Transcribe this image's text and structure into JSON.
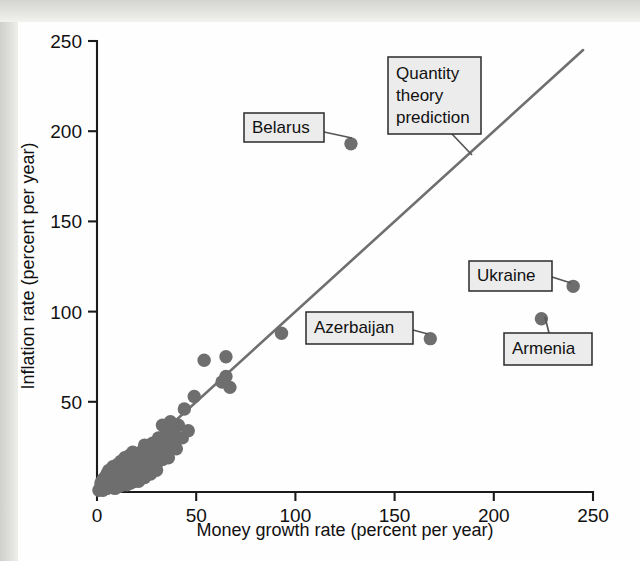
{
  "figure": {
    "background_color": "#fefefe",
    "margin_color": "#dcdcd8"
  },
  "chart_data": {
    "type": "scatter",
    "title": "",
    "xlabel": "Money growth rate (percent per year)",
    "ylabel": "Inflation rate (percent per year)",
    "xlim": [
      0,
      250
    ],
    "ylim": [
      0,
      250
    ],
    "xticks": [
      0,
      50,
      100,
      150,
      200,
      250
    ],
    "yticks": [
      50,
      100,
      150,
      200,
      250
    ],
    "xtick_labels": [
      "0",
      "50",
      "100",
      "150",
      "200",
      "250"
    ],
    "ytick_labels": [
      "50",
      "100",
      "150",
      "200",
      "250"
    ],
    "grid": false,
    "legend": "none",
    "marker_color": "#6e6e6e",
    "marker_size": 7,
    "reference_line": {
      "name": "Quantity theory prediction",
      "type": "line",
      "slope": 1,
      "intercept": 0,
      "x": [
        0,
        245
      ],
      "y": [
        0,
        245
      ],
      "color": "#6f6f6f"
    },
    "points": [
      {
        "x": 128,
        "y": 193,
        "label": "Belarus"
      },
      {
        "x": 168,
        "y": 85,
        "label": "Azerbaijan"
      },
      {
        "x": 240,
        "y": 114,
        "label": "Ukraine"
      },
      {
        "x": 224,
        "y": 96,
        "label": "Armenia"
      },
      {
        "x": 93,
        "y": 88,
        "label": ""
      },
      {
        "x": 65,
        "y": 75,
        "label": ""
      },
      {
        "x": 54,
        "y": 73,
        "label": ""
      },
      {
        "x": 65,
        "y": 64,
        "label": ""
      },
      {
        "x": 63,
        "y": 61,
        "label": ""
      },
      {
        "x": 67,
        "y": 58,
        "label": ""
      },
      {
        "x": 49,
        "y": 53,
        "label": ""
      },
      {
        "x": 44,
        "y": 46,
        "label": ""
      },
      {
        "x": 37,
        "y": 39,
        "label": ""
      },
      {
        "x": 41,
        "y": 37,
        "label": ""
      },
      {
        "x": 33,
        "y": 37,
        "label": ""
      },
      {
        "x": 36,
        "y": 33,
        "label": ""
      },
      {
        "x": 39,
        "y": 32,
        "label": ""
      },
      {
        "x": 34,
        "y": 31,
        "label": ""
      },
      {
        "x": 36,
        "y": 30,
        "label": ""
      },
      {
        "x": 31,
        "y": 30,
        "label": ""
      },
      {
        "x": 38,
        "y": 28,
        "label": ""
      },
      {
        "x": 35,
        "y": 27,
        "label": ""
      },
      {
        "x": 33,
        "y": 25,
        "label": ""
      },
      {
        "x": 30,
        "y": 24,
        "label": ""
      },
      {
        "x": 28,
        "y": 27,
        "label": ""
      },
      {
        "x": 24,
        "y": 26,
        "label": ""
      },
      {
        "x": 26,
        "y": 24,
        "label": ""
      },
      {
        "x": 22,
        "y": 22,
        "label": ""
      },
      {
        "x": 32,
        "y": 20,
        "label": ""
      },
      {
        "x": 36,
        "y": 19,
        "label": ""
      },
      {
        "x": 25,
        "y": 20,
        "label": ""
      },
      {
        "x": 21,
        "y": 19,
        "label": ""
      },
      {
        "x": 19,
        "y": 21,
        "label": ""
      },
      {
        "x": 20,
        "y": 17,
        "label": ""
      },
      {
        "x": 23,
        "y": 16,
        "label": ""
      },
      {
        "x": 18,
        "y": 16,
        "label": ""
      },
      {
        "x": 17,
        "y": 18,
        "label": ""
      },
      {
        "x": 16,
        "y": 14,
        "label": ""
      },
      {
        "x": 15,
        "y": 16,
        "label": ""
      },
      {
        "x": 14,
        "y": 13,
        "label": ""
      },
      {
        "x": 19,
        "y": 13,
        "label": ""
      },
      {
        "x": 13,
        "y": 15,
        "label": ""
      },
      {
        "x": 12,
        "y": 12,
        "label": ""
      },
      {
        "x": 17,
        "y": 11,
        "label": ""
      },
      {
        "x": 11,
        "y": 13,
        "label": ""
      },
      {
        "x": 10,
        "y": 11,
        "label": ""
      },
      {
        "x": 14,
        "y": 10,
        "label": ""
      },
      {
        "x": 9,
        "y": 12,
        "label": ""
      },
      {
        "x": 8,
        "y": 10,
        "label": ""
      },
      {
        "x": 12,
        "y": 9,
        "label": ""
      },
      {
        "x": 7,
        "y": 11,
        "label": ""
      },
      {
        "x": 6,
        "y": 9,
        "label": ""
      },
      {
        "x": 10,
        "y": 8,
        "label": ""
      },
      {
        "x": 5,
        "y": 10,
        "label": ""
      },
      {
        "x": 4,
        "y": 8,
        "label": ""
      },
      {
        "x": 8,
        "y": 7,
        "label": ""
      },
      {
        "x": 6,
        "y": 6,
        "label": ""
      },
      {
        "x": 3,
        "y": 7,
        "label": ""
      },
      {
        "x": 5,
        "y": 5,
        "label": ""
      },
      {
        "x": 9,
        "y": 6,
        "label": ""
      },
      {
        "x": 11,
        "y": 7,
        "label": ""
      },
      {
        "x": 13,
        "y": 8,
        "label": ""
      },
      {
        "x": 15,
        "y": 9,
        "label": ""
      },
      {
        "x": 7,
        "y": 4,
        "label": ""
      },
      {
        "x": 4,
        "y": 4,
        "label": ""
      },
      {
        "x": 3,
        "y": 3,
        "label": ""
      },
      {
        "x": 2,
        "y": 5,
        "label": ""
      },
      {
        "x": 6,
        "y": 3,
        "label": ""
      },
      {
        "x": 2,
        "y": 2,
        "label": ""
      },
      {
        "x": 8,
        "y": 3,
        "label": ""
      },
      {
        "x": 10,
        "y": 4,
        "label": ""
      },
      {
        "x": 12,
        "y": 5,
        "label": ""
      },
      {
        "x": 14,
        "y": 6,
        "label": ""
      },
      {
        "x": 16,
        "y": 7,
        "label": ""
      },
      {
        "x": 18,
        "y": 8,
        "label": ""
      },
      {
        "x": 20,
        "y": 10,
        "label": ""
      },
      {
        "x": 22,
        "y": 12,
        "label": ""
      },
      {
        "x": 24,
        "y": 14,
        "label": ""
      },
      {
        "x": 26,
        "y": 16,
        "label": ""
      },
      {
        "x": 28,
        "y": 18,
        "label": ""
      },
      {
        "x": 1,
        "y": 1,
        "label": ""
      },
      {
        "x": 5,
        "y": 2,
        "label": ""
      },
      {
        "x": 3,
        "y": 1,
        "label": ""
      },
      {
        "x": 9,
        "y": 2,
        "label": ""
      },
      {
        "x": 11,
        "y": 3,
        "label": ""
      },
      {
        "x": 13,
        "y": 4,
        "label": ""
      },
      {
        "x": 17,
        "y": 5,
        "label": ""
      },
      {
        "x": 19,
        "y": 6,
        "label": ""
      },
      {
        "x": 21,
        "y": 8,
        "label": ""
      },
      {
        "x": 23,
        "y": 10,
        "label": ""
      },
      {
        "x": 25,
        "y": 12,
        "label": ""
      },
      {
        "x": 27,
        "y": 13,
        "label": ""
      },
      {
        "x": 29,
        "y": 15,
        "label": ""
      },
      {
        "x": 31,
        "y": 17,
        "label": ""
      },
      {
        "x": 33,
        "y": 18,
        "label": ""
      },
      {
        "x": 15,
        "y": 4,
        "label": ""
      },
      {
        "x": 7,
        "y": 8,
        "label": ""
      },
      {
        "x": 4,
        "y": 6,
        "label": ""
      },
      {
        "x": 2,
        "y": 3,
        "label": ""
      },
      {
        "x": 6,
        "y": 12,
        "label": ""
      },
      {
        "x": 10,
        "y": 15,
        "label": ""
      },
      {
        "x": 12,
        "y": 17,
        "label": ""
      },
      {
        "x": 8,
        "y": 14,
        "label": ""
      },
      {
        "x": 14,
        "y": 19,
        "label": ""
      },
      {
        "x": 16,
        "y": 20,
        "label": ""
      },
      {
        "x": 18,
        "y": 22,
        "label": ""
      },
      {
        "x": 30,
        "y": 12,
        "label": ""
      },
      {
        "x": 27,
        "y": 10,
        "label": ""
      },
      {
        "x": 24,
        "y": 8,
        "label": ""
      },
      {
        "x": 21,
        "y": 6,
        "label": ""
      },
      {
        "x": 29,
        "y": 22,
        "label": ""
      },
      {
        "x": 26,
        "y": 21,
        "label": ""
      },
      {
        "x": 34,
        "y": 23,
        "label": ""
      },
      {
        "x": 40,
        "y": 24,
        "label": ""
      },
      {
        "x": 43,
        "y": 30,
        "label": ""
      },
      {
        "x": 46,
        "y": 34,
        "label": ""
      }
    ]
  },
  "callouts": [
    {
      "id": "belarus",
      "text": "Belarus",
      "lines": [
        "Belarus"
      ],
      "target": {
        "x": 128,
        "y": 193
      }
    },
    {
      "id": "quantity-theory",
      "text": "Quantity theory prediction",
      "lines": [
        "Quantity",
        "theory",
        "prediction"
      ],
      "target": null
    },
    {
      "id": "azerbaijan",
      "text": "Azerbaijan",
      "lines": [
        "Azerbaijan"
      ],
      "target": {
        "x": 168,
        "y": 85
      }
    },
    {
      "id": "ukraine",
      "text": "Ukraine",
      "lines": [
        "Ukraine"
      ],
      "target": {
        "x": 240,
        "y": 114
      }
    },
    {
      "id": "armenia",
      "text": "Armenia",
      "lines": [
        "Armenia"
      ],
      "target": {
        "x": 224,
        "y": 96
      }
    }
  ]
}
